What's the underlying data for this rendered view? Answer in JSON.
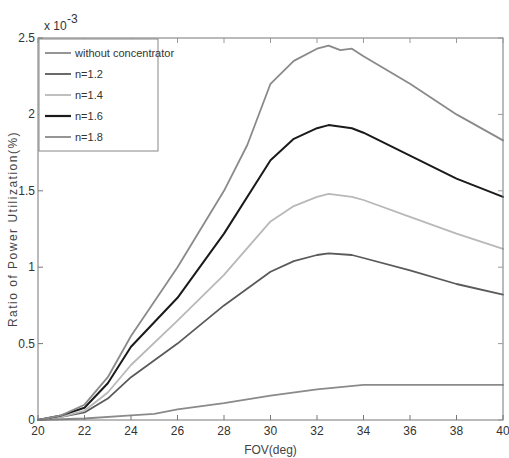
{
  "chart_data": {
    "type": "line",
    "title": "",
    "xlabel": "FOV(deg)",
    "ylabel": "Ratio of Power Utilization(%)",
    "y_multiplier": "x 10",
    "y_exponent": "-3",
    "xlim": [
      20,
      40
    ],
    "ylim": [
      0,
      2.5
    ],
    "xticks": [
      20,
      22,
      24,
      26,
      28,
      30,
      32,
      34,
      36,
      38,
      40
    ],
    "yticks": [
      0,
      0.5,
      1,
      1.5,
      2,
      2.5
    ],
    "ytick_labels": [
      "0",
      "0.5",
      "1",
      "1.5",
      "2",
      "2.5"
    ],
    "grid": false,
    "legend_position": "upper left",
    "series": [
      {
        "name": "without concentrator",
        "color": "#8a8a8a",
        "x": [
          20,
          22,
          24,
          25,
          26,
          28,
          30,
          32,
          34,
          36,
          38,
          40
        ],
        "values": [
          0,
          0.01,
          0.03,
          0.04,
          0.07,
          0.11,
          0.16,
          0.2,
          0.23,
          0.23,
          0.23,
          0.23
        ]
      },
      {
        "name": "n=1.2",
        "color": "#5a5a5a",
        "x": [
          20,
          21,
          22,
          23,
          24,
          26,
          28,
          30,
          31,
          32,
          32.5,
          33.5,
          34,
          36,
          38,
          40
        ],
        "values": [
          0,
          0.02,
          0.05,
          0.14,
          0.28,
          0.5,
          0.75,
          0.97,
          1.04,
          1.08,
          1.09,
          1.08,
          1.06,
          0.98,
          0.89,
          0.82
        ]
      },
      {
        "name": "n=1.4",
        "color": "#b8b8b8",
        "x": [
          20,
          21,
          22,
          23,
          24,
          26,
          28,
          30,
          31,
          32,
          32.5,
          33.5,
          34,
          36,
          38,
          40
        ],
        "values": [
          0,
          0.02,
          0.06,
          0.18,
          0.36,
          0.65,
          0.95,
          1.3,
          1.4,
          1.46,
          1.48,
          1.46,
          1.44,
          1.33,
          1.22,
          1.12
        ]
      },
      {
        "name": "n=1.6",
        "color": "#1a1a1a",
        "x": [
          20,
          21,
          22,
          23,
          24,
          26,
          28,
          30,
          31,
          32,
          32.5,
          33.5,
          34,
          36,
          38,
          40
        ],
        "values": [
          0,
          0.03,
          0.08,
          0.24,
          0.48,
          0.8,
          1.22,
          1.7,
          1.84,
          1.91,
          1.93,
          1.91,
          1.88,
          1.73,
          1.58,
          1.46
        ]
      },
      {
        "name": "n=1.8",
        "color": "#8a8a8a",
        "x": [
          20,
          21,
          22,
          23,
          24,
          26,
          28,
          29,
          30,
          31,
          32,
          32.5,
          33,
          33.5,
          34,
          36,
          38,
          40
        ],
        "values": [
          0,
          0.03,
          0.1,
          0.28,
          0.55,
          1.0,
          1.5,
          1.8,
          2.2,
          2.35,
          2.43,
          2.45,
          2.42,
          2.43,
          2.38,
          2.2,
          2.0,
          1.83
        ]
      }
    ]
  }
}
